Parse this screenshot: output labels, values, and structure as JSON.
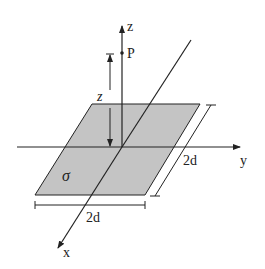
{
  "diagram": {
    "colors": {
      "plane_fill": "#c4c4c4",
      "stroke": "#222222",
      "background": "#ffffff"
    },
    "labels": {
      "z_axis": "z",
      "y_axis": "y",
      "x_axis": "x",
      "point": "P",
      "height": "z",
      "charge_density": "σ",
      "width_bottom": "2d",
      "width_side": "2d"
    }
  }
}
